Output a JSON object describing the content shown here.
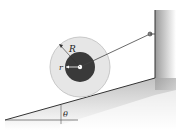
{
  "diagram": {
    "type": "physics-diagram",
    "labels": {
      "outer_radius": "R",
      "inner_radius": "r",
      "incline_angle": "θ"
    },
    "colors": {
      "outer_disk": "#e6e6e6",
      "outer_disk_edge": "#c8c8c8",
      "inner_hub": "#3a3a3a",
      "incline_shade": "#cfcfcf",
      "wall_shade": "#bdbdbd",
      "line": "#333333"
    },
    "elements": [
      {
        "name": "inclined-plane",
        "from": [
          5,
          120
        ],
        "to": [
          155,
          78
        ]
      },
      {
        "name": "vertical-wall",
        "x": 155,
        "top": 10,
        "bottom": 78
      },
      {
        "name": "outer-disk",
        "center": [
          80,
          67
        ],
        "radius": 30
      },
      {
        "name": "inner-hub",
        "center": [
          80,
          67
        ],
        "radius": 15
      },
      {
        "name": "cable",
        "from": [
          80,
          67
        ],
        "to": [
          150,
          34
        ]
      },
      {
        "name": "wall-pin",
        "at": [
          150,
          34
        ]
      },
      {
        "name": "horizontal-reference",
        "from": [
          5,
          120
        ],
        "to": [
          78,
          120
        ]
      }
    ]
  }
}
